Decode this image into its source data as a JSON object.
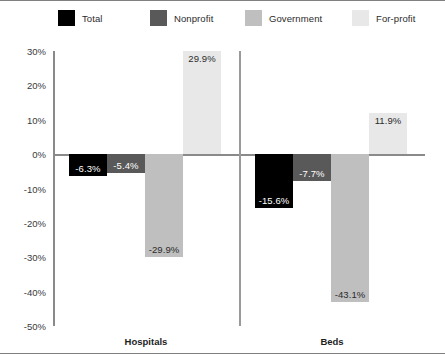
{
  "chart_data": {
    "type": "bar",
    "title": "",
    "subtitle": "",
    "xlabel": "",
    "ylabel": "",
    "categories": [
      "Hospitals",
      "Beds"
    ],
    "series": [
      {
        "name": "Total",
        "color": "#000000",
        "values": [
          -6.3,
          -15.6
        ],
        "labels": [
          "-6.3%",
          "-15.6%"
        ]
      },
      {
        "name": "Nonprofit",
        "color": "#595959",
        "values": [
          -5.4,
          -7.7
        ],
        "labels": [
          "-5.4%",
          "-7.7%"
        ]
      },
      {
        "name": "Government",
        "color": "#bfbfbf",
        "values": [
          -29.9,
          -43.1
        ],
        "labels": [
          "-29.9%",
          "-43.1%"
        ]
      },
      {
        "name": "For-profit",
        "color": "#e8e8e8",
        "values": [
          29.9,
          11.9
        ],
        "labels": [
          "29.9%",
          "11.9%"
        ]
      }
    ],
    "ylim": [
      -50,
      30
    ],
    "ytick_values": [
      30,
      20,
      10,
      0,
      -10,
      -20,
      -30,
      -40,
      -50
    ],
    "ytick_labels": [
      "30%",
      "20%",
      "10%",
      "0%",
      "-10%",
      "-20%",
      "-30%",
      "-40%",
      "-50%"
    ],
    "grid": false,
    "legend_position": "top",
    "zero_line": true,
    "group_separator": true
  },
  "legend": {
    "items": [
      {
        "label": "Total",
        "color": "#000000",
        "x": 58
      },
      {
        "label": "Nonprofit",
        "color": "#595959",
        "x": 150
      },
      {
        "label": "Government",
        "color": "#bfbfbf",
        "x": 245
      },
      {
        "label": "For-profit",
        "color": "#e8e8e8",
        "x": 352
      }
    ]
  },
  "axis": {
    "line_color": "#8a8a8a",
    "label_color": "#3a3a3a"
  }
}
